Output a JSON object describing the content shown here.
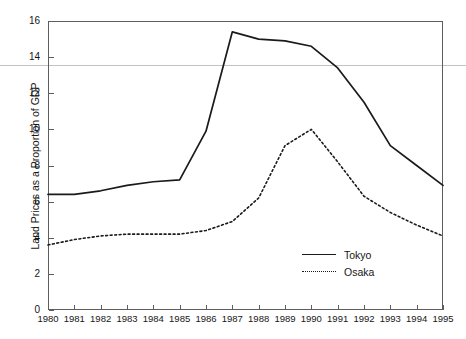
{
  "chart_data": {
    "type": "line",
    "title": "",
    "xlabel": "",
    "ylabel": "Land Prices as a Proportion of GDP",
    "categories": [
      "1980",
      "1981",
      "1982",
      "1983",
      "1984",
      "1985",
      "1986",
      "1987",
      "1988",
      "1989",
      "1990",
      "1991",
      "1992",
      "1993",
      "1994",
      "1995"
    ],
    "x": [
      1980,
      1981,
      1982,
      1983,
      1984,
      1985,
      1986,
      1987,
      1988,
      1989,
      1990,
      1991,
      1992,
      1993,
      1994,
      1995
    ],
    "series": [
      {
        "name": "Tokyo",
        "style": "solid",
        "color": "#1a1a1a",
        "values": [
          6.4,
          6.4,
          6.6,
          6.9,
          7.1,
          7.2,
          9.9,
          15.4,
          15.0,
          14.9,
          14.6,
          13.4,
          11.5,
          9.1,
          8.0,
          6.9
        ]
      },
      {
        "name": "Osaka",
        "style": "dotted",
        "color": "#1a1a1a",
        "values": [
          3.6,
          3.9,
          4.1,
          4.2,
          4.2,
          4.2,
          4.4,
          4.9,
          6.2,
          9.1,
          10.0,
          8.2,
          6.3,
          5.4,
          4.7,
          4.1
        ]
      }
    ],
    "ylim": [
      0,
      16
    ],
    "yticks": [
      0,
      2,
      4,
      6,
      8,
      10,
      12,
      14,
      16
    ],
    "ytick_labels": [
      "0",
      "2",
      "4",
      "6",
      "8",
      "10",
      "12",
      "14",
      "16"
    ],
    "xlim": [
      1980,
      1995
    ],
    "grid": false,
    "legend_position": "inside-lower-right",
    "frame": "box"
  },
  "legend": {
    "entries": [
      {
        "label": "Tokyo",
        "style": "solid"
      },
      {
        "label": "Osaka",
        "style": "dotted"
      }
    ]
  },
  "artifacts": {
    "scan_line_note": "",
    "title_remnant": ""
  }
}
